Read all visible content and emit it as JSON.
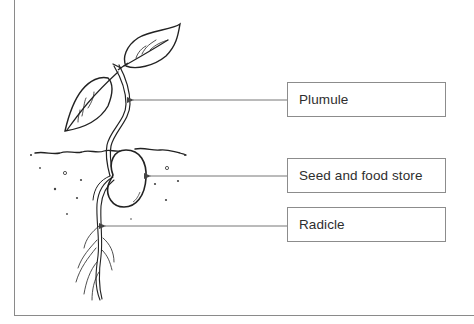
{
  "diagram": {
    "labels": [
      {
        "id": "plumule",
        "text": "Plumule",
        "arrow_y": 100,
        "arrow_tip_x": 131,
        "box_top": 82
      },
      {
        "id": "seed",
        "text": "Seed and food store",
        "arrow_y": 176,
        "arrow_tip_x": 148,
        "box_top": 158
      },
      {
        "id": "radicle",
        "text": "Radicle",
        "arrow_y": 226,
        "arrow_tip_x": 103,
        "box_top": 207
      }
    ],
    "colors": {
      "line": "#777777",
      "ink": "#222222",
      "frame": "#8a8a8a",
      "box_border": "#8c8c8c",
      "text": "#2e2e2e"
    }
  }
}
